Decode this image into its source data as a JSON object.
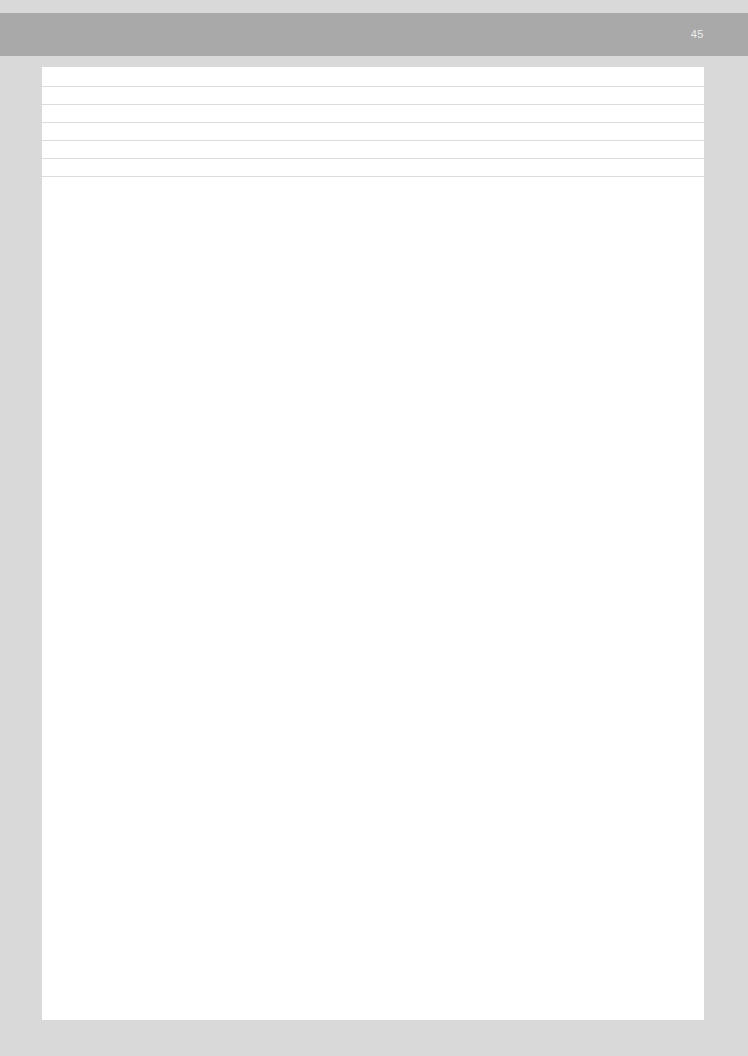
{
  "header": {
    "page_number": "45",
    "band_color": "#a9a9a9"
  },
  "sheet": {
    "background": "#ffffff",
    "ruled_lines": [
      {
        "y": 19
      },
      {
        "y": 37
      },
      {
        "y": 55
      },
      {
        "y": 73
      },
      {
        "y": 91
      },
      {
        "y": 109
      }
    ]
  }
}
